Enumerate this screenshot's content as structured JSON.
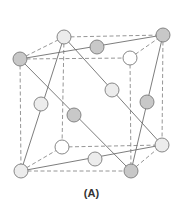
{
  "figure": {
    "caption": "(A)",
    "colors": {
      "background": "#ffffff",
      "edge": "#8a8a8a",
      "solid_line": "#6e6e6e",
      "atom_stroke": "#7a7a7a",
      "atom_gray": "#c8c8c8",
      "atom_light": "#ececec",
      "atom_white": "#ffffff"
    },
    "atom_radius": 7,
    "atoms": [
      {
        "id": "top-left-back",
        "x": 64,
        "y": 37,
        "type": "light"
      },
      {
        "id": "top-right-back",
        "x": 163,
        "y": 35,
        "type": "gray"
      },
      {
        "id": "top-edge-mid",
        "x": 97,
        "y": 47,
        "type": "gray"
      },
      {
        "id": "top-left-front",
        "x": 20,
        "y": 59,
        "type": "gray"
      },
      {
        "id": "top-right-front",
        "x": 130,
        "y": 58,
        "type": "white"
      },
      {
        "id": "upper-center-right",
        "x": 112,
        "y": 90,
        "type": "light"
      },
      {
        "id": "right-mid",
        "x": 147,
        "y": 102,
        "type": "gray"
      },
      {
        "id": "left-mid",
        "x": 41,
        "y": 104,
        "type": "light"
      },
      {
        "id": "body-center",
        "x": 74,
        "y": 115,
        "type": "gray"
      },
      {
        "id": "bottom-left-back",
        "x": 62,
        "y": 147,
        "type": "white"
      },
      {
        "id": "bottom-right-back",
        "x": 162,
        "y": 145,
        "type": "light"
      },
      {
        "id": "bottom-edge-mid",
        "x": 95,
        "y": 159,
        "type": "light"
      },
      {
        "id": "bottom-left-front",
        "x": 21,
        "y": 171,
        "type": "light"
      },
      {
        "id": "bottom-right-front",
        "x": 131,
        "y": 171,
        "type": "gray"
      }
    ],
    "dashed_edges": [
      [
        20,
        59,
        64,
        37
      ],
      [
        64,
        37,
        163,
        35
      ],
      [
        20,
        59,
        130,
        58
      ],
      [
        130,
        58,
        163,
        35
      ],
      [
        20,
        59,
        21,
        171
      ],
      [
        64,
        37,
        62,
        147
      ],
      [
        130,
        58,
        131,
        171
      ],
      [
        163,
        35,
        162,
        145
      ],
      [
        21,
        171,
        131,
        171
      ],
      [
        62,
        147,
        162,
        145
      ],
      [
        21,
        171,
        62,
        147
      ],
      [
        131,
        171,
        162,
        145
      ]
    ],
    "solid_lines": [
      [
        20,
        59,
        163,
        35
      ],
      [
        20,
        59,
        131,
        171
      ],
      [
        64,
        37,
        21,
        171
      ],
      [
        64,
        37,
        162,
        145
      ],
      [
        163,
        35,
        131,
        171
      ],
      [
        21,
        171,
        162,
        145
      ]
    ]
  }
}
